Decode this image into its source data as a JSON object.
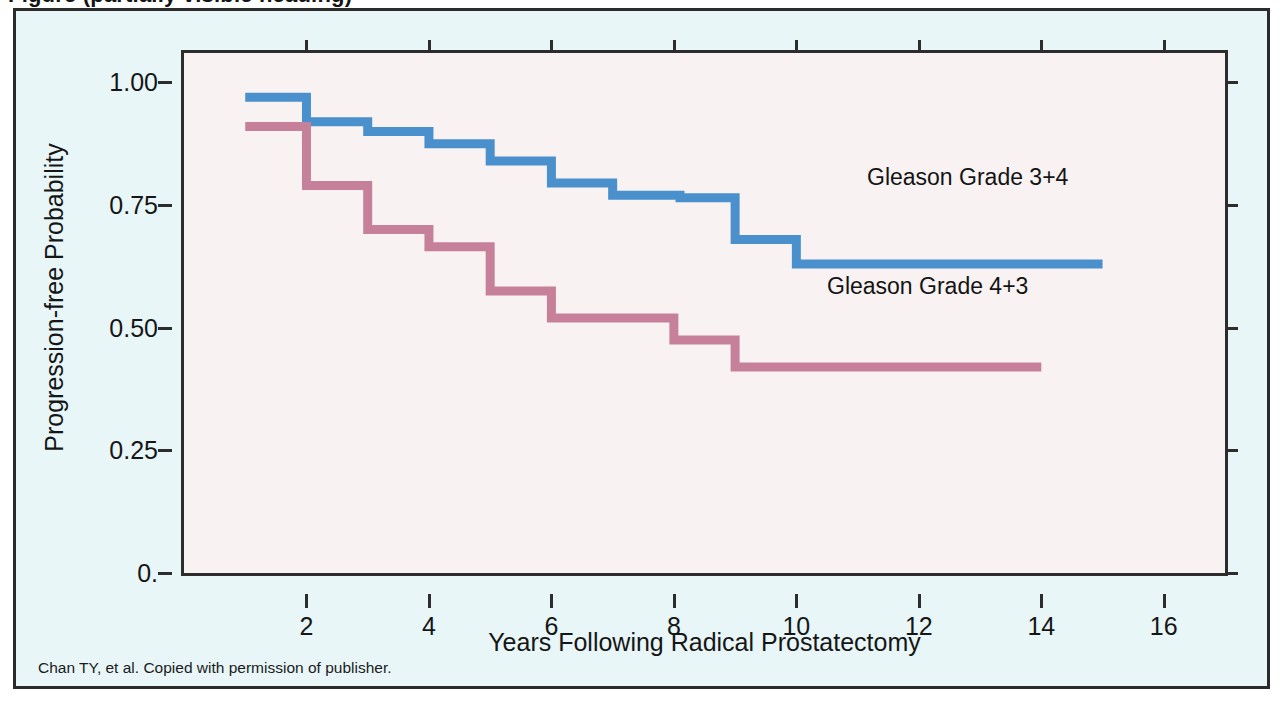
{
  "page": {
    "cut_off_heading": "Figure (partially visible heading)",
    "background_color": "#ffffff"
  },
  "card": {
    "background_color": "#e8f6f8",
    "border_color": "#2b2b2b"
  },
  "footnote": {
    "text": "Chan TY, et al. Copied with permission of publisher."
  },
  "annotations": [
    {
      "label": "Gleason Grade 3+4",
      "x_px": 848,
      "y_px": 150
    },
    {
      "label": "Gleason Grade 4+3",
      "x_px": 808,
      "y_px": 259
    }
  ],
  "chart_data": {
    "type": "line",
    "subtype": "kaplan-meier-step",
    "title": "",
    "xlabel": "Years Following Radical Prostatectomy",
    "ylabel": "Progression-free Probability",
    "xlim": [
      0,
      17
    ],
    "ylim": [
      0,
      1.06
    ],
    "grid": false,
    "legend_position": "in-plot-annotations",
    "plot_background": "#f8f3f2",
    "frame_color": "#2d2d2d",
    "xticks": [
      2,
      4,
      6,
      8,
      10,
      12,
      14,
      16
    ],
    "xtick_labels": [
      "2",
      "4",
      "6",
      "8",
      "10",
      "12",
      "14",
      "16"
    ],
    "yticks": [
      0,
      0.25,
      0.5,
      0.75,
      1.0
    ],
    "ytick_labels": [
      "0.",
      "0.25",
      "0.50",
      "0.75",
      "1.00"
    ],
    "series": [
      {
        "name": "Gleason Grade 3+4",
        "color": "#4a90cc",
        "x": [
          1.0,
          2.0,
          2.0,
          3.0,
          3.0,
          4.0,
          4.0,
          5.0,
          5.0,
          6.0,
          6.0,
          7.0,
          7.0,
          8.0,
          8.1,
          9.0,
          9.0,
          10.0,
          10.0,
          15.0
        ],
        "y": [
          0.97,
          0.97,
          0.92,
          0.92,
          0.9,
          0.9,
          0.875,
          0.875,
          0.84,
          0.84,
          0.795,
          0.795,
          0.77,
          0.77,
          0.765,
          0.765,
          0.68,
          0.68,
          0.63,
          0.63
        ],
        "steps": [
          {
            "year": 1.0,
            "value": 0.97
          },
          {
            "year": 2.0,
            "value": 0.92
          },
          {
            "year": 3.0,
            "value": 0.9
          },
          {
            "year": 4.0,
            "value": 0.875
          },
          {
            "year": 5.0,
            "value": 0.84
          },
          {
            "year": 6.0,
            "value": 0.795
          },
          {
            "year": 7.0,
            "value": 0.77
          },
          {
            "year": 8.1,
            "value": 0.765
          },
          {
            "year": 9.0,
            "value": 0.68
          },
          {
            "year": 10.0,
            "value": 0.63
          }
        ],
        "plateau_value": 0.63,
        "end_year": 15.0
      },
      {
        "name": "Gleason Grade 4+3",
        "color": "#c68099",
        "x": [
          1.0,
          2.0,
          2.0,
          3.0,
          3.0,
          4.0,
          4.0,
          5.0,
          5.0,
          6.0,
          6.0,
          8.0,
          8.0,
          9.0,
          9.0,
          14.0
        ],
        "y": [
          0.91,
          0.91,
          0.79,
          0.79,
          0.7,
          0.7,
          0.665,
          0.665,
          0.575,
          0.575,
          0.52,
          0.52,
          0.475,
          0.475,
          0.42,
          0.42
        ],
        "steps": [
          {
            "year": 1.0,
            "value": 0.91
          },
          {
            "year": 2.0,
            "value": 0.79
          },
          {
            "year": 3.0,
            "value": 0.7
          },
          {
            "year": 4.0,
            "value": 0.665
          },
          {
            "year": 5.0,
            "value": 0.575
          },
          {
            "year": 6.0,
            "value": 0.52
          },
          {
            "year": 8.0,
            "value": 0.475
          },
          {
            "year": 9.0,
            "value": 0.42
          }
        ],
        "plateau_value": 0.42,
        "end_year": 14.0
      }
    ]
  }
}
